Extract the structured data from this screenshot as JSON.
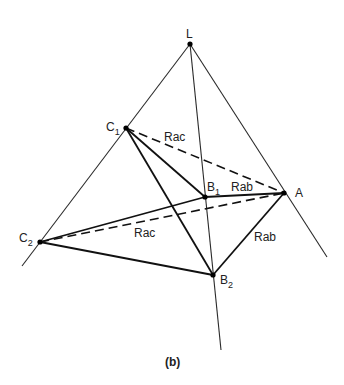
{
  "diagram": {
    "caption": "(b)",
    "points": {
      "L": {
        "label": "L",
        "sub": "",
        "x": 190,
        "y": 44
      },
      "C1": {
        "label": "C",
        "sub": "1",
        "x": 126,
        "y": 128
      },
      "B1": {
        "label": "B",
        "sub": "1",
        "x": 205,
        "y": 197
      },
      "A": {
        "label": "A",
        "sub": "",
        "x": 284,
        "y": 193
      },
      "C2": {
        "label": "C",
        "sub": "2",
        "x": 40,
        "y": 242
      },
      "B2": {
        "label": "B",
        "sub": "2",
        "x": 213,
        "y": 275
      }
    },
    "edge_labels": {
      "rac_upper": "Rac",
      "rab_upper": "Rab",
      "rac_lower": "Rac",
      "rab_lower": "Rab"
    },
    "rays": [
      {
        "name": "ray-left",
        "from": "L",
        "to": [
          22,
          266
        ]
      },
      {
        "name": "ray-middle",
        "from": "L",
        "to": [
          221,
          350
        ]
      },
      {
        "name": "ray-right",
        "from": "L",
        "to": [
          327,
          257
        ]
      }
    ],
    "solid_edges": [
      [
        "C1",
        "B1"
      ],
      [
        "C1",
        "B2"
      ],
      [
        "B1",
        "A"
      ],
      [
        "A",
        "B2"
      ],
      [
        "C2",
        "A"
      ],
      [
        "C2",
        "B2"
      ]
    ],
    "dashed_edges": [
      [
        "C1",
        "A"
      ],
      [
        "C2",
        "A"
      ]
    ]
  }
}
